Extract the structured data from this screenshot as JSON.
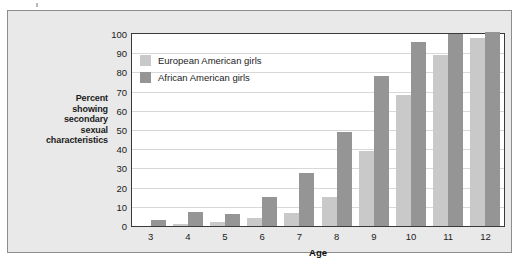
{
  "chart_data": {
    "type": "bar",
    "title": "",
    "xlabel": "Age",
    "ylabel": "Percent showing secondary sexual characteristics",
    "ylabel_lines": [
      "Percent",
      "showing",
      "secondary",
      "sexual",
      "characteristics"
    ],
    "categories": [
      "3",
      "4",
      "5",
      "6",
      "7",
      "8",
      "9",
      "10",
      "11",
      "12"
    ],
    "series": [
      {
        "name": "European American girls",
        "color": "#c9c9c9",
        "values": [
          0,
          1,
          2,
          4,
          7,
          15,
          39,
          68,
          89,
          98
        ]
      },
      {
        "name": "African American girls",
        "color": "#959595",
        "values": [
          3,
          7.5,
          6,
          15,
          27.5,
          49,
          78,
          96,
          100,
          101
        ]
      }
    ],
    "ylim": [
      0,
      100
    ],
    "ytick_labels": [
      "100",
      "90",
      "80",
      "70",
      "60",
      "50",
      "40",
      "30",
      "20",
      "10",
      "0"
    ],
    "ytick_values": [
      100,
      90,
      80,
      70,
      60,
      50,
      40,
      30,
      20,
      10,
      0
    ],
    "grid": true,
    "legend_position": "upper-left-inside"
  },
  "figure": {
    "background_color": "#e9e9e9",
    "plot_background_color": "#ffffff",
    "border_color": "#8d8d8d"
  }
}
